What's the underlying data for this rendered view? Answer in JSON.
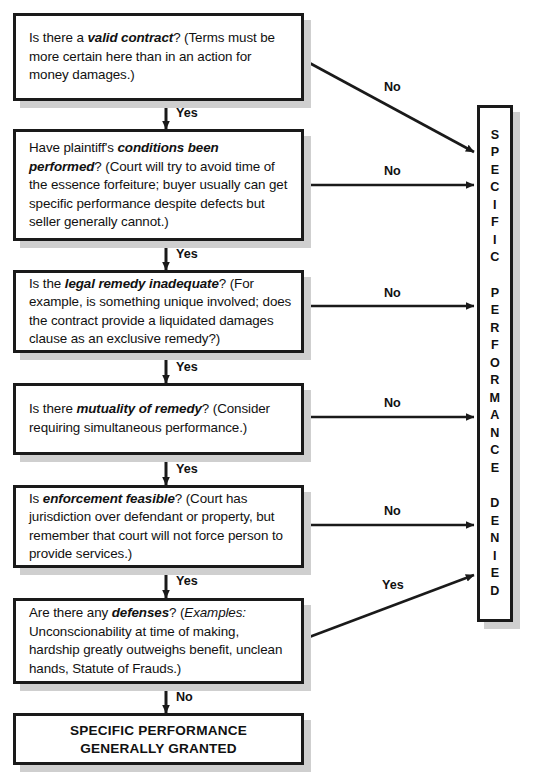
{
  "chart": {
    "type": "flowchart"
  },
  "nodes": [
    {
      "id": "valid-contract",
      "lead": "Is there a ",
      "emph": "valid contract",
      "rest": "? (Terms must be more certain here than in an action for money damages.)",
      "full_text": "Is there a valid contract? (Terms must be more certain here than in an action for money damages.)"
    },
    {
      "id": "conditions-performed",
      "lead": "Have plaintiff's ",
      "emph": "conditions been performed",
      "rest": "? (Court will try to avoid time of the essence forfeiture; buyer usually can get specific performance despite defects but seller generally cannot.)",
      "full_text": "Have plaintiff's conditions been performed? (Court will try to avoid time of the essence forfeiture; buyer usually can get specific performance despite defects but seller generally cannot.)"
    },
    {
      "id": "legal-remedy-inadequate",
      "lead": "Is the ",
      "emph": "legal remedy inadequate",
      "rest": "? (For example, is something unique involved; does the contract provide a liquidated damages clause as an exclusive remedy?)",
      "full_text": "Is the legal remedy inadequate? (For example, is something unique involved; does the contract provide a liquidated damages clause as an exclusive remedy?)"
    },
    {
      "id": "mutuality-of-remedy",
      "lead": "Is there ",
      "emph": "mutuality of remedy",
      "rest": "? (Consider requiring simultaneous performance.)",
      "full_text": "Is there mutuality of remedy? (Consider requiring simultaneous performance.)"
    },
    {
      "id": "enforcement-feasible",
      "lead": "Is ",
      "emph": "enforcement feasible",
      "rest": "? (Court has jurisdiction over defendant or property, but remember that court will not force person to provide services.)",
      "full_text": "Is enforcement feasible? (Court has jurisdiction over defendant or property, but remember that court will not force person to provide services.)"
    },
    {
      "id": "defenses",
      "lead": "Are there any ",
      "emph": "defenses",
      "rest_italic": "Examples:",
      "rest": "? (Examples: Unconscionability at time of making, hardship greatly outweighs benefit, unclean hands, Statute of Frauds.)",
      "rest_tail": " Unconscionability at time of making, hardship greatly outweighs benefit, unclean hands, Statute of Frauds.)",
      "rest_head": "? (",
      "full_text": "Are there any defenses? (Examples: Unconscionability at time of making, hardship greatly outweighs benefit, unclean hands, Statute of Frauds.)"
    }
  ],
  "terminal": {
    "line1": "SPECIFIC PERFORMANCE",
    "line2": "GENERALLY GRANTED"
  },
  "denied_box": {
    "text": "SPECIFIC PERFORMANCE DENIED",
    "letters": "S\nP\nE\nC\nI\nF\nI\nC\n \nP\nE\nR\nF\nO\nR\nM\nA\nN\nC\nE\n \nD\nE\nN\nI\nE\nD"
  },
  "edges": {
    "yes_1": "Yes",
    "yes_2": "Yes",
    "yes_3": "Yes",
    "yes_4": "Yes",
    "yes_5": "Yes",
    "no_1": "No",
    "no_2": "No",
    "no_3": "No",
    "no_4": "No",
    "no_5": "No",
    "yes_defenses": "Yes",
    "no_final": "No"
  },
  "colors": {
    "stroke": "#1a1a1a",
    "shadow": "#cfcfcf",
    "background": "#ffffff",
    "text": "#111111"
  }
}
